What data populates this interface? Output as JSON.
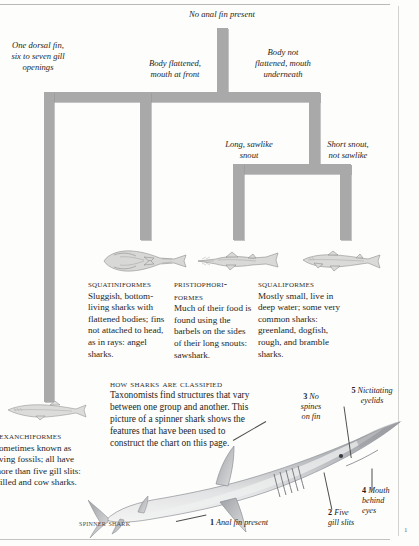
{
  "page": {
    "folio": "1",
    "background": "#fdfdfc",
    "tree_color": "#a9a9a9",
    "rule_color": "#b9b9b7"
  },
  "tree": {
    "root_label": "No anal fin present",
    "branch_labels": [
      {
        "name": "one-dorsal-fin",
        "text": "One dorsal fin,\nsix to seven gill\nopenings"
      },
      {
        "name": "body-flattened",
        "text": "Body flattened,\nmouth at front"
      },
      {
        "name": "body-not-flattened",
        "text": "Body not\nflattened, mouth\nunderneath"
      },
      {
        "name": "long-sawlike-snout",
        "text": "Long, sawlike\nsnout"
      },
      {
        "name": "short-snout",
        "text": "Short snout,\nnot sawlike"
      }
    ],
    "labels": {
      "root": "No anal fin present",
      "one_dorsal_l1": "One dorsal fin,",
      "one_dorsal_l2": "six to seven gill",
      "one_dorsal_l3": "openings",
      "flattened_l1": "Body flattened,",
      "flattened_l2": "mouth at front",
      "notflat_l1": "Body not",
      "notflat_l2": "flattened, mouth",
      "notflat_l3": "underneath",
      "sawlike_l1": "Long, sawlike",
      "sawlike_l2": "snout",
      "shortsnout_l1": "Short snout,",
      "shortsnout_l2": "not sawlike"
    }
  },
  "orders": [
    {
      "key": "squatiniformes",
      "head": "Squatiniformes",
      "body": "Sluggish, bottom-living sharks with flattened bodies; fins not attached to head, as in rays: angel sharks."
    },
    {
      "key": "pristiophoriformes",
      "head": "Pristiophori-formes",
      "body": "Much of their food is found using the barbels on the sides of their long snouts: sawshark."
    },
    {
      "key": "squaliformes",
      "head": "Squaliformes",
      "body": "Mostly small, live in deep water; some very common sharks: greenland, dogfish, rough, and bramble sharks."
    }
  ],
  "hexanchiformes": {
    "head": "Hexanchiformes",
    "body": "Sometimes known as living fossils; all have more than five gill slits: frilled and cow sharks."
  },
  "how_classified": {
    "head": "How sharks are classified",
    "body": "Taxonomists find structures that vary between one group and another. This picture of a spinner shark shows the features that have been used to construct the chart on this page."
  },
  "spinner_shark": {
    "caption": "Spinner shark",
    "callouts": [
      {
        "num": "1",
        "text": "Anal fin present"
      },
      {
        "num": "2",
        "text": "Five\ngill slits"
      },
      {
        "num": "3",
        "text": "No\nspines\non fin"
      },
      {
        "num": "4",
        "text": "Mouth\nbehind\neyes"
      },
      {
        "num": "5",
        "text": "Nictitating\neyelids"
      }
    ],
    "callout_text": {
      "c1_num": "1",
      "c1_a": "Anal fin present",
      "c2_num": "2",
      "c2_a": "Five",
      "c2_b": "gill slits",
      "c3_num": "3",
      "c3_a": "No",
      "c3_b": "spines",
      "c3_c": "on fin",
      "c4_num": "4",
      "c4_a": "Mouth",
      "c4_b": "behind",
      "c4_c": "eyes",
      "c5_num": "5",
      "c5_a": "Nictitating",
      "c5_b": "eyelids"
    }
  }
}
